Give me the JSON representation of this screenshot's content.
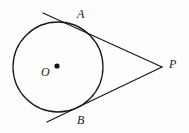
{
  "figure": {
    "name": "circle-with-two-tangent-lines-from-external-point",
    "background_color": "#fdfdfd",
    "stroke_color": "#1a1a1a",
    "labels": {
      "A": "A",
      "B": "B",
      "P": "P",
      "O": "O"
    },
    "circle": {
      "center_x": 58,
      "center_y": 67,
      "radius": 45,
      "stroke_width": 1.3
    },
    "center_dot": {
      "x": 57,
      "y": 66,
      "radius": 2.6
    },
    "external_point": {
      "x": 162,
      "y": 67
    },
    "tangent_points": {
      "A": {
        "x": 78,
        "y": 26
      },
      "B": {
        "x": 78,
        "y": 108
      }
    },
    "tangent_line_upper": {
      "from_x": 43,
      "from_y": 13,
      "to_x": 162,
      "to_y": 67,
      "stroke_width": 1.3
    },
    "tangent_line_lower": {
      "from_x": 47,
      "from_y": 122,
      "to_x": 162,
      "to_y": 67,
      "stroke_width": 1.3
    }
  }
}
